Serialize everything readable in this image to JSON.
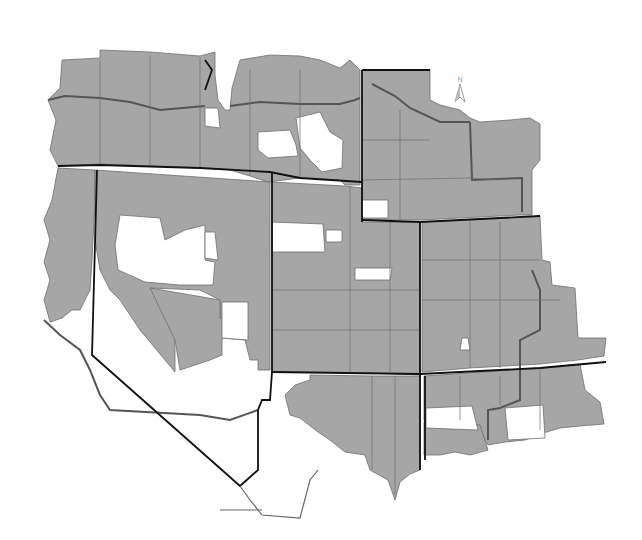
{
  "map": {
    "type": "choropleth",
    "description": "Western US county map, counties shaded gray (included) or white (not included)",
    "colors": {
      "filled": "#a6a6a6",
      "unfilled": "#ffffff",
      "state_border": "#111111",
      "region_border": "#555555",
      "county_border": "#6e6e6e"
    },
    "north_arrow": {
      "label": "N"
    },
    "legend": []
  }
}
